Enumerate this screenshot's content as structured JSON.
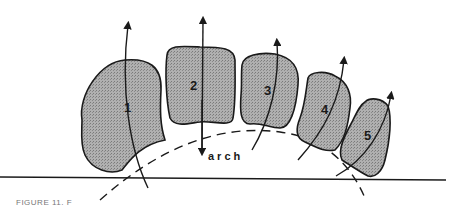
{
  "diagram": {
    "stones": [
      {
        "label": "1"
      },
      {
        "label": "2"
      },
      {
        "label": "3"
      },
      {
        "label": "4"
      },
      {
        "label": "5"
      }
    ],
    "arch_label": "arch",
    "caption": "FIGURE 11. F",
    "colors": {
      "stroke": "#1a1a1a",
      "fill": "#a8a8a8",
      "background": "#ffffff"
    }
  }
}
